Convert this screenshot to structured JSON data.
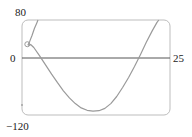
{
  "chart_data": {
    "type": "line",
    "title": "",
    "xlabel": "",
    "ylabel": "",
    "xlim": [
      0,
      25
    ],
    "ylim": [
      -120,
      80
    ],
    "grid": false,
    "tick_labels": {
      "y_top": "80",
      "y_zero": "0",
      "y_bottom": "−120",
      "x_right": "25"
    },
    "series": [
      {
        "name": "curve-upper-branch",
        "points": [
          [
            1.0,
            27
          ],
          [
            1.3,
            35
          ],
          [
            1.7,
            48
          ],
          [
            2.1,
            62
          ],
          [
            2.5,
            74
          ],
          [
            2.7,
            80
          ]
        ]
      },
      {
        "name": "curve-main",
        "points": [
          [
            1.0,
            27
          ],
          [
            1.5,
            28
          ],
          [
            2.0,
            22
          ],
          [
            3.0,
            4
          ],
          [
            4.0,
            -15
          ],
          [
            5.0,
            -34
          ],
          [
            6.0,
            -52
          ],
          [
            7.0,
            -69
          ],
          [
            8.0,
            -84
          ],
          [
            9.0,
            -96
          ],
          [
            10.0,
            -105
          ],
          [
            11.0,
            -110
          ],
          [
            12.0,
            -112
          ],
          [
            13.0,
            -111
          ],
          [
            14.0,
            -106
          ],
          [
            15.0,
            -96
          ],
          [
            16.0,
            -81
          ],
          [
            17.0,
            -62
          ],
          [
            18.0,
            -41
          ],
          [
            19.0,
            -18
          ],
          [
            20.0,
            7
          ],
          [
            21.0,
            33
          ],
          [
            22.0,
            57
          ],
          [
            22.8,
            75
          ],
          [
            23.1,
            80
          ]
        ]
      }
    ],
    "colors": {
      "curve": "#9a9a9a",
      "frame": "#bdbdbd",
      "axis": "#555555",
      "text": "#222222"
    }
  }
}
